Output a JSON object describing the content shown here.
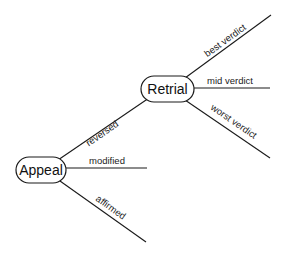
{
  "diagram": {
    "type": "decision-tree",
    "nodes": [
      {
        "id": "appeal",
        "label": "Appeal"
      },
      {
        "id": "retrial",
        "label": "Retrial"
      }
    ],
    "edges": [
      {
        "from": "appeal",
        "to": "retrial",
        "label": "reversed"
      },
      {
        "from": "appeal",
        "to": null,
        "label": "modified"
      },
      {
        "from": "appeal",
        "to": null,
        "label": "affirmed"
      },
      {
        "from": "retrial",
        "to": null,
        "label": "best verdict"
      },
      {
        "from": "retrial",
        "to": null,
        "label": "mid verdict"
      },
      {
        "from": "retrial",
        "to": null,
        "label": "worst verdict"
      }
    ]
  },
  "colors": {
    "line": "#1a1a1a",
    "background": "#ffffff"
  }
}
